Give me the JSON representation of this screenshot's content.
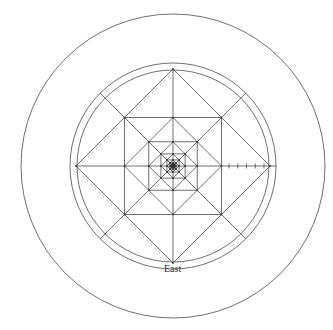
{
  "diagram": {
    "type": "nested-squares-in-circles",
    "label_bottom": "East",
    "stroke_color": "#333333",
    "background": "#ffffff",
    "center": [
      173,
      166
    ],
    "outer_circle_radius": 152,
    "ring_outer_radius": 103,
    "ring_inner_radius": 97,
    "nested_levels": 8,
    "tick_count_right_axis": 5
  }
}
